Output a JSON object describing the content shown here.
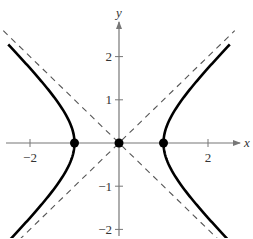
{
  "chart_data": {
    "type": "line",
    "title": "",
    "xlabel": "x",
    "ylabel": "y",
    "equation": "x^2 - y^2 = 1",
    "xlim": [
      -2.6,
      2.7
    ],
    "ylim": [
      -2.2,
      2.6
    ],
    "grid": false,
    "legend": null,
    "x_ticks": [
      -2,
      2
    ],
    "x_tick_labels": [
      "−2",
      "2"
    ],
    "y_ticks": [
      -2,
      -1,
      1,
      2
    ],
    "y_tick_labels": [
      "−2",
      "−1",
      "1",
      "2"
    ],
    "series": [
      {
        "name": "hyperbola right branch",
        "style": "solid",
        "x": [
          2.49,
          2.0,
          1.5,
          1.2,
          1.0,
          1.2,
          1.5,
          2.0,
          2.49
        ],
        "y": [
          2.28,
          1.73,
          1.12,
          0.66,
          0.0,
          -0.66,
          -1.12,
          -1.73,
          -2.28
        ]
      },
      {
        "name": "hyperbola left branch",
        "style": "solid",
        "x": [
          -2.49,
          -2.0,
          -1.5,
          -1.2,
          -1.0,
          -1.2,
          -1.5,
          -2.0,
          -2.49
        ],
        "y": [
          2.28,
          1.73,
          1.12,
          0.66,
          0.0,
          -0.66,
          -1.12,
          -1.73,
          -2.28
        ]
      },
      {
        "name": "asymptote y = x",
        "style": "dashed",
        "x": [
          -2.6,
          2.6
        ],
        "y": [
          -2.6,
          2.6
        ]
      },
      {
        "name": "asymptote y = -x",
        "style": "dashed",
        "x": [
          -2.6,
          2.6
        ],
        "y": [
          2.6,
          -2.6
        ]
      }
    ],
    "points": [
      {
        "label": "vertex left",
        "x": -1,
        "y": 0
      },
      {
        "label": "center",
        "x": 0,
        "y": 0
      },
      {
        "label": "vertex right",
        "x": 1,
        "y": 0
      }
    ]
  },
  "style": {
    "curve_color": "#000000",
    "axis_color": "#777777",
    "dash_color": "#555555"
  }
}
